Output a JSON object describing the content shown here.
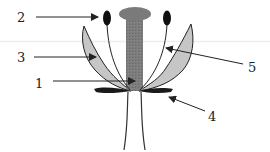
{
  "diagram": {
    "colors": {
      "petal_fill": "#c4c4c4",
      "pistil_fill": "#7a7a7a",
      "outline": "#222222",
      "anther": "#111111",
      "sepal": "#1a1a1a"
    },
    "labels": [
      {
        "id": "1",
        "text": "1",
        "part": "ovary / receptacle base"
      },
      {
        "id": "2",
        "text": "2",
        "part": "anther"
      },
      {
        "id": "3",
        "text": "3",
        "part": "petal"
      },
      {
        "id": "4",
        "text": "4",
        "part": "sepal"
      },
      {
        "id": "5",
        "text": "5",
        "part": "filament"
      }
    ]
  }
}
